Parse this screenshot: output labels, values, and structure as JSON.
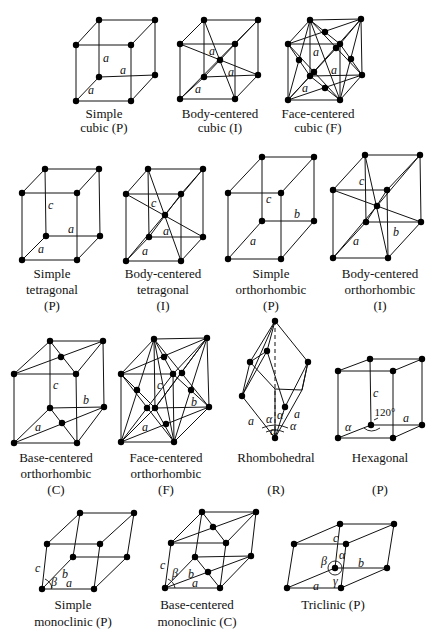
{
  "figure": {
    "lattices": [
      {
        "id": "simple-cubic",
        "caption": [
          "Simple",
          "cubic (P)"
        ],
        "edge_labels": [
          "a",
          "a",
          "a"
        ]
      },
      {
        "id": "body-centered-cubic",
        "caption": [
          "Body-centered",
          "cubic (I)"
        ],
        "edge_labels": [
          "a",
          "a",
          "a"
        ]
      },
      {
        "id": "face-centered-cubic",
        "caption": [
          "Face-centered",
          "cubic (F)"
        ],
        "edge_labels": [
          "a",
          "a",
          "a"
        ]
      },
      {
        "id": "simple-tetragonal",
        "caption": [
          "Simple",
          "tetragonal",
          "(P)"
        ],
        "edge_labels": [
          "c",
          "a",
          "a"
        ]
      },
      {
        "id": "body-centered-tetragonal",
        "caption": [
          "Body-centered",
          "tetragonal",
          "(I)"
        ],
        "edge_labels": [
          "c",
          "a",
          "a"
        ]
      },
      {
        "id": "simple-orthorhombic",
        "caption": [
          "Simple",
          "orthorhombic",
          "(P)"
        ],
        "edge_labels": [
          "c",
          "b",
          "a"
        ]
      },
      {
        "id": "body-centered-orthorhombic",
        "caption": [
          "Body-centered",
          "orthorhombic",
          "(I)"
        ],
        "edge_labels": [
          "c",
          "b",
          "a"
        ]
      },
      {
        "id": "base-centered-orthorhombic",
        "caption": [
          "Base-centered",
          "orthorhombic",
          "(C)"
        ],
        "edge_labels": [
          "c",
          "b",
          "a"
        ]
      },
      {
        "id": "face-centered-orthorhombic",
        "caption": [
          "Face-centered",
          "orthorhombic",
          "(F)"
        ],
        "edge_labels": [
          "c",
          "b",
          "a"
        ]
      },
      {
        "id": "rhombohedral",
        "caption": [
          "Rhombohedral",
          "(R)"
        ],
        "edge_labels": [
          "a",
          "a",
          "α",
          "α",
          "α",
          "α"
        ]
      },
      {
        "id": "hexagonal",
        "caption": [
          "Hexagonal",
          "(P)"
        ],
        "edge_labels": [
          "c",
          "a",
          "α",
          "120°"
        ]
      },
      {
        "id": "simple-monoclinic",
        "caption": [
          "Simple",
          "monoclinic (P)"
        ],
        "edge_labels": [
          "c",
          "b",
          "a",
          "β"
        ]
      },
      {
        "id": "base-centered-monoclinic",
        "caption": [
          "Base-centered",
          "monoclinic (C)"
        ],
        "edge_labels": [
          "c",
          "b",
          "a",
          "β"
        ]
      },
      {
        "id": "triclinic",
        "caption": [
          "Triclinic (P)"
        ],
        "edge_labels": [
          "c",
          "b",
          "a",
          "α",
          "β",
          "γ"
        ]
      }
    ]
  }
}
